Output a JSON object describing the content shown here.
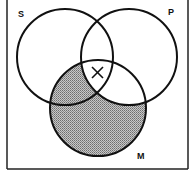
{
  "diagram": {
    "type": "venn-3",
    "labels": {
      "s": "S",
      "p": "P",
      "m": "M"
    },
    "shaded_region": "M outside P",
    "mark": {
      "symbol": "X",
      "region": "S∩P∩M"
    },
    "colors": {
      "stroke": "#111111",
      "shade": "#9a9a9a",
      "background": "#ffffff"
    }
  }
}
